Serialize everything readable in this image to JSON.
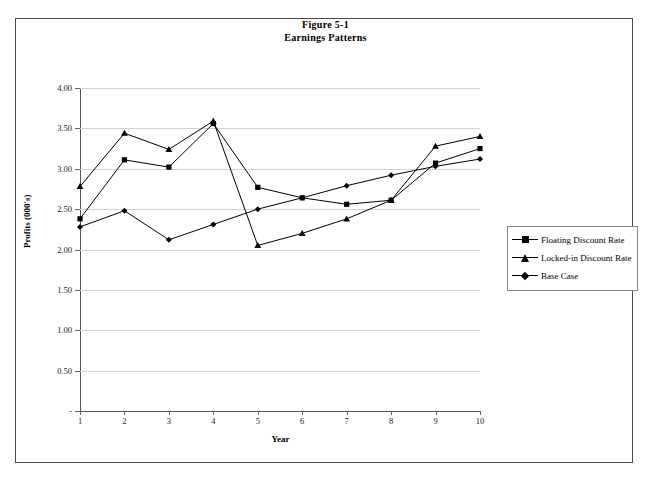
{
  "title": {
    "line1": "Figure 5-1",
    "line2": "Earnings Patterns"
  },
  "axes": {
    "ylabel": "Profits (000's)",
    "xlabel": "Year",
    "yticks": [
      "4.00",
      "3.50",
      "3.00",
      "2.50",
      "2.00",
      "1.50",
      "1.00",
      "0.50",
      "-"
    ],
    "xticks": [
      "1",
      "2",
      "3",
      "4",
      "5",
      "6",
      "7",
      "8",
      "9",
      "10"
    ]
  },
  "legend": {
    "items": [
      {
        "label": "Floating Discount Rate",
        "marker": "square-marker"
      },
      {
        "label": "Locked-in Discount Rate",
        "marker": "triangle-marker"
      },
      {
        "label": "Base Case",
        "marker": "diamond-marker"
      }
    ]
  },
  "chart_data": {
    "type": "line",
    "title": "Figure 5-1 Earnings Patterns",
    "xlabel": "Year",
    "ylabel": "Profits (000's)",
    "x": [
      1,
      2,
      3,
      4,
      5,
      6,
      7,
      8,
      9,
      10
    ],
    "ylim": [
      0,
      4.0
    ],
    "xlim": [
      1,
      10
    ],
    "grid": true,
    "legend_position": "right",
    "series": [
      {
        "name": "Floating Discount Rate",
        "marker": "square",
        "values": [
          2.38,
          3.11,
          3.02,
          3.56,
          2.77,
          2.64,
          2.56,
          2.61,
          3.07,
          3.25
        ]
      },
      {
        "name": "Locked-in Discount Rate",
        "marker": "triangle",
        "values": [
          2.78,
          3.44,
          3.24,
          3.59,
          2.05,
          2.2,
          2.38,
          2.61,
          3.28,
          3.4
        ]
      },
      {
        "name": "Base Case",
        "marker": "diamond",
        "values": [
          2.28,
          2.48,
          2.12,
          2.31,
          2.5,
          2.64,
          2.79,
          2.92,
          3.03,
          3.12
        ]
      }
    ]
  }
}
